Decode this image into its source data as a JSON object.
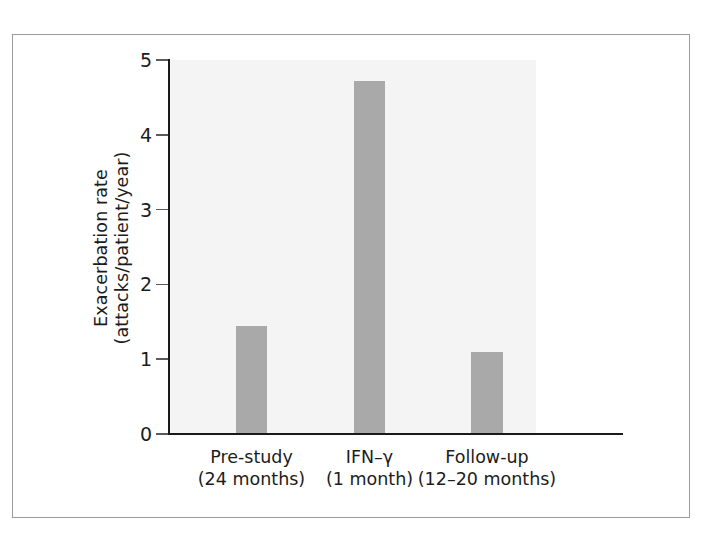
{
  "figure": {
    "background": "#ffffff",
    "frame_color": "#9a9a9a",
    "plot_background": "#f4f4f4",
    "bar_color": "#a9a9a9",
    "axis_color": "#1a1a1a"
  },
  "chart_data": {
    "type": "bar",
    "title": "",
    "xlabel": "",
    "ylabel": "Exacerbation rate (attacks/patient/year)",
    "ylabel_line1": "Exacerbation rate",
    "ylabel_line2": "(attacks/patient/year)",
    "ylim": [
      0,
      5
    ],
    "yticks": [
      0,
      1,
      2,
      3,
      4,
      5
    ],
    "ytick_labels": [
      "0",
      "1",
      "2",
      "3",
      "4",
      "5"
    ],
    "grid": false,
    "legend": null,
    "categories": [
      {
        "line1": "Pre-study",
        "line2": "(24 months)"
      },
      {
        "line1": "IFN–γ",
        "line2": "(1 month)"
      },
      {
        "line1": "Follow-up",
        "line2": "(12–20 months)"
      }
    ],
    "category_labels": [
      "Pre-study (24 months)",
      "IFN–γ (1 month)",
      "Follow-up (12–20 months)"
    ],
    "values": [
      1.45,
      4.72,
      1.1
    ],
    "series": [
      {
        "name": "Exacerbation rate",
        "values": [
          1.45,
          4.72,
          1.1
        ]
      }
    ]
  }
}
